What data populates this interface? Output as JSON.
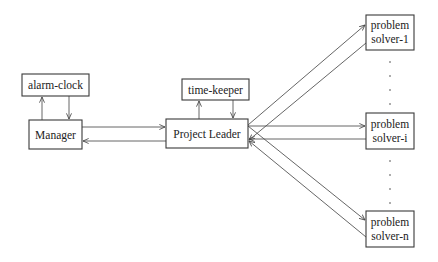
{
  "diagram": {
    "nodes": [
      {
        "id": "alarm-clock",
        "lines": [
          "alarm-clock"
        ]
      },
      {
        "id": "manager",
        "lines": [
          "Manager"
        ]
      },
      {
        "id": "time-keeper",
        "lines": [
          "time-keeper"
        ]
      },
      {
        "id": "project-leader",
        "lines": [
          "Project Leader"
        ]
      },
      {
        "id": "solver-1",
        "lines": [
          "problem",
          "solver-1"
        ]
      },
      {
        "id": "solver-i",
        "lines": [
          "problem",
          "solver-i"
        ]
      },
      {
        "id": "solver-n",
        "lines": [
          "problem",
          "solver-n"
        ]
      }
    ],
    "edges": [
      {
        "from": "manager",
        "to": "alarm-clock"
      },
      {
        "from": "alarm-clock",
        "to": "manager"
      },
      {
        "from": "project-leader",
        "to": "time-keeper"
      },
      {
        "from": "time-keeper",
        "to": "project-leader"
      },
      {
        "from": "manager",
        "to": "project-leader"
      },
      {
        "from": "project-leader",
        "to": "manager"
      },
      {
        "from": "project-leader",
        "to": "solver-1"
      },
      {
        "from": "solver-1",
        "to": "project-leader"
      },
      {
        "from": "project-leader",
        "to": "solver-i"
      },
      {
        "from": "solver-i",
        "to": "project-leader"
      },
      {
        "from": "project-leader",
        "to": "solver-n"
      },
      {
        "from": "solver-n",
        "to": "project-leader"
      }
    ],
    "ellipsis": "·"
  }
}
